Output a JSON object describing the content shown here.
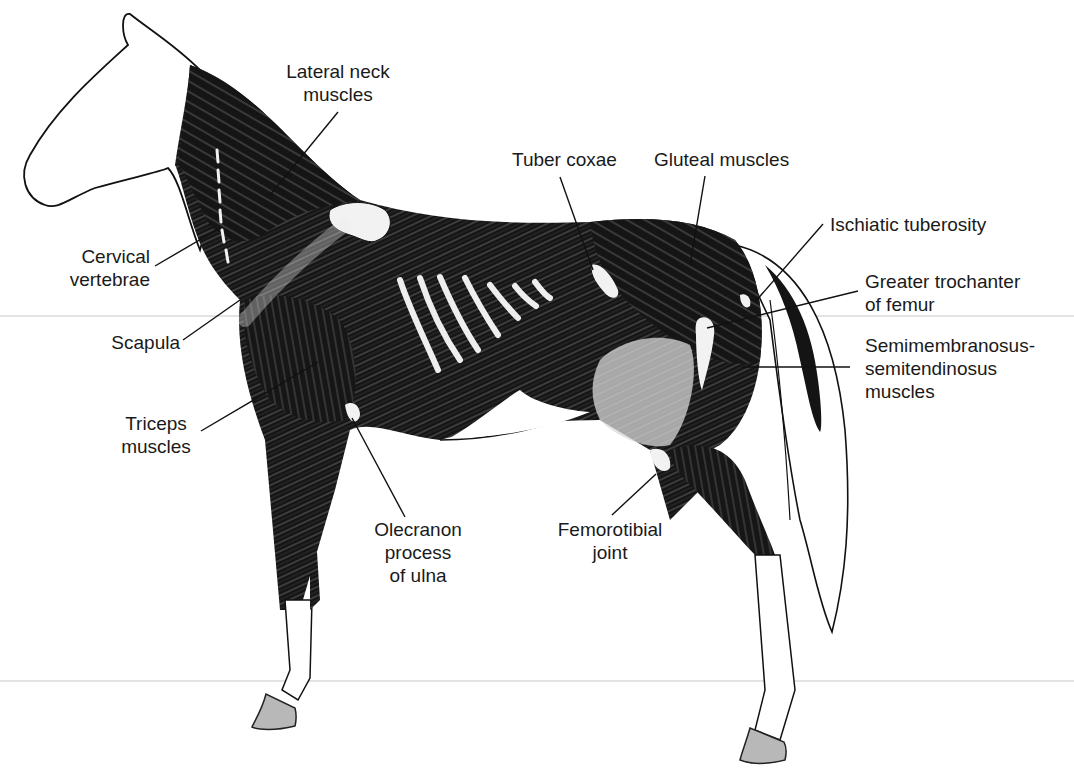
{
  "figure": {
    "colors": {
      "muscle": "#141414",
      "outline": "#111111",
      "bone_highlight": "#f2f2f2",
      "hoof": "#b8b8b8",
      "label_text": "#1a1a1a",
      "background": "#ffffff"
    }
  },
  "labels": {
    "lateral_neck": [
      "Lateral neck",
      "muscles"
    ],
    "cervical_vertebrae": [
      "Cervical",
      "vertebrae"
    ],
    "scapula": [
      "Scapula"
    ],
    "triceps": [
      "Triceps",
      "muscles"
    ],
    "olecranon": [
      "Olecranon",
      "process",
      "of ulna"
    ],
    "tuber_coxae": [
      "Tuber coxae"
    ],
    "gluteal": [
      "Gluteal muscles"
    ],
    "ischiatic": [
      "Ischiatic tuberosity"
    ],
    "greater_trochanter": [
      "Greater trochanter",
      "of femur"
    ],
    "semimembranosus": [
      "Semimembranosus-",
      "semitendinosus",
      "muscles"
    ],
    "femorotibial": [
      "Femorotibial",
      "joint"
    ]
  }
}
